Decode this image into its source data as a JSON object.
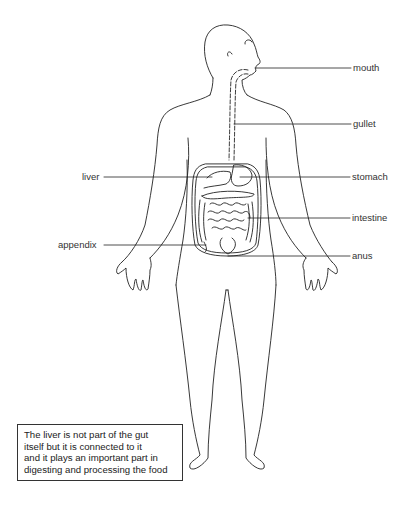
{
  "diagram": {
    "labels": {
      "mouth": "mouth",
      "gullet": "gullet",
      "liver": "liver",
      "stomach": "stomach",
      "intestine": "intestine",
      "appendix": "appendix",
      "anus": "anus"
    },
    "note": {
      "lines": [
        "The liver is not part of the gut",
        "itself but it is connected to it",
        "and it plays an important part in",
        "digesting and processing the food"
      ]
    },
    "colors": {
      "line": "#222222",
      "background": "#ffffff",
      "text": "#333333"
    }
  }
}
